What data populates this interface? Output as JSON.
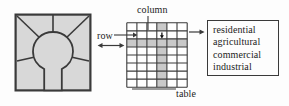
{
  "diagram": {
    "background_color": "#fdfdfd",
    "line_color": "#3a3a3a",
    "map": {
      "name": "land-use map",
      "fill_color": "#d8d8d8",
      "border_color": "#3a3a3a",
      "feature": "central circular zone with radiating boundary lines and a southward corridor"
    },
    "grid": {
      "name": "raster table",
      "columns": 6,
      "rows": 8,
      "cell_fill": "#ffffff",
      "highlight_fill": "#c9c9c9",
      "line_color": "#3a3a3a",
      "highlighted_column_index": 4,
      "highlighted_row_index": 2,
      "marked_cell": {
        "column": 4,
        "row": 2,
        "marker": "arrow-marker"
      }
    },
    "labels": {
      "column": "column",
      "row": "row",
      "table": "table"
    },
    "categories": {
      "name": "land-use categories",
      "items": [
        "residential",
        "agricultural",
        "commercial",
        "industrial"
      ]
    },
    "connectors": {
      "map_to_grid": "double-headed-arrow",
      "grid_to_categories": "right-arrow",
      "column_leader": "leader-line",
      "row_leader": "leader-line-arrow",
      "table_leader": "leader-line"
    }
  }
}
